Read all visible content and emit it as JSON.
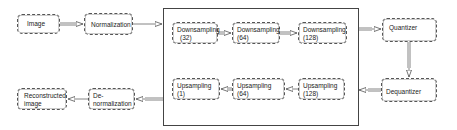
{
  "diagram": {
    "nodes": {
      "image": "Image",
      "normalization": "Normalization",
      "down32": {
        "line1": "Downsampling",
        "line2": "(32)"
      },
      "down64": {
        "line1": "Downsampling",
        "line2": "(64)"
      },
      "down128": {
        "line1": "Downsampling",
        "line2": "(128)"
      },
      "quantizer": "Quantizer",
      "dequantizer": "Dequantizer",
      "up128": {
        "line1": "Upsampling",
        "line2": "(128)"
      },
      "up64": {
        "line1": "Upsampling",
        "line2": "(64)"
      },
      "up1": {
        "line1": "Upsampling",
        "line2": "(1)"
      },
      "denormalization": {
        "line1": "De-",
        "line2": "normalization"
      },
      "reconstructed": {
        "line1": "Reconstructed",
        "line2": "image"
      }
    },
    "edges": [
      [
        "Image",
        "Normalization"
      ],
      [
        "Normalization",
        "Downsampling (32)"
      ],
      [
        "Downsampling (32)",
        "Downsampling (64)"
      ],
      [
        "Downsampling (64)",
        "Downsampling (128)"
      ],
      [
        "Downsampling (128)",
        "Quantizer"
      ],
      [
        "Quantizer",
        "Dequantizer"
      ],
      [
        "Dequantizer",
        "Upsampling (128)"
      ],
      [
        "Upsampling (128)",
        "Upsampling (64)"
      ],
      [
        "Upsampling (64)",
        "Upsampling (1)"
      ],
      [
        "Upsampling (1)",
        "De-normalization"
      ],
      [
        "De-normalization",
        "Reconstructed image"
      ]
    ]
  }
}
